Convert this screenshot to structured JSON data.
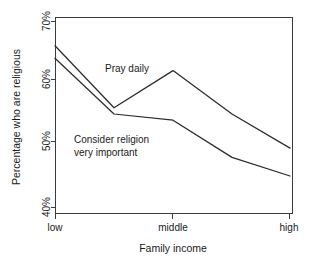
{
  "chart_data": {
    "type": "line",
    "title": "",
    "xlabel": "Family income",
    "ylabel": "Percentage who are religious",
    "x": [
      "low",
      "",
      "middle",
      "",
      "high"
    ],
    "categories": [
      "low",
      "",
      "middle",
      "",
      "high"
    ],
    "xtick_labels": [
      "low",
      "middle",
      "high"
    ],
    "ytick_labels": [
      "70%",
      "60%",
      "50%",
      "40%"
    ],
    "ytick_values": [
      70,
      60,
      50,
      40
    ],
    "ylim": [
      40,
      70
    ],
    "grid": false,
    "legend": "inline-annotations",
    "series": [
      {
        "name": "Pray daily",
        "values": [
          66,
          56,
          62,
          55,
          49.5
        ]
      },
      {
        "name": "Consider religion very important",
        "values": [
          64,
          55,
          54,
          48,
          45
        ]
      }
    ],
    "annotations": [
      {
        "id": "pray-daily-label",
        "text": "Pray daily",
        "x_px": 105,
        "y_px": 71
      },
      {
        "id": "consider-religion-label-line1",
        "text": "Consider religion",
        "x_px": 74,
        "y_px": 140
      },
      {
        "id": "consider-religion-label-line2",
        "text": "very important",
        "x_px": 74,
        "y_px": 153
      }
    ],
    "axis_geometry": {
      "plot_left_px": 55,
      "plot_right_px": 292,
      "plot_top_px": 17,
      "plot_bottom_px": 213,
      "x_positions_px": [
        55,
        114,
        173,
        232,
        290
      ],
      "ytick_positions_px": [
        21,
        79,
        141,
        207
      ],
      "xtick_positions_px": [
        55,
        173,
        289
      ]
    }
  }
}
